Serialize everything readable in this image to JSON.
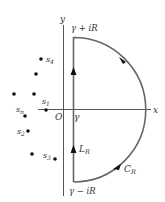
{
  "diagram": {
    "axes": {
      "x_label": "x",
      "y_label": "y",
      "origin_label": "O",
      "gamma_label": "γ"
    },
    "contour": {
      "top_label": "γ + iR",
      "bottom_label": "γ − iR",
      "line_label": "L",
      "line_sub": "R",
      "arc_label": "C",
      "arc_sub": "R"
    },
    "singularities": [
      {
        "label": "s",
        "sub": "4",
        "x": 41,
        "y": 59
      },
      {
        "label": "",
        "sub": "",
        "x": 36,
        "y": 74
      },
      {
        "label": "",
        "sub": "",
        "x": 14,
        "y": 94
      },
      {
        "label": "",
        "sub": "",
        "x": 34,
        "y": 94
      },
      {
        "label": "s",
        "sub": "1",
        "x": 46,
        "y": 110
      },
      {
        "label": "s",
        "sub": "n",
        "x": 25,
        "y": 116
      },
      {
        "label": "s",
        "sub": "2",
        "x": 28,
        "y": 131
      },
      {
        "label": "",
        "sub": "",
        "x": 32,
        "y": 154
      },
      {
        "label": "s",
        "sub": "3",
        "x": 55,
        "y": 159
      }
    ],
    "colors": {
      "axis": "#555555",
      "contour": "#666666",
      "dot": "#111111"
    }
  }
}
